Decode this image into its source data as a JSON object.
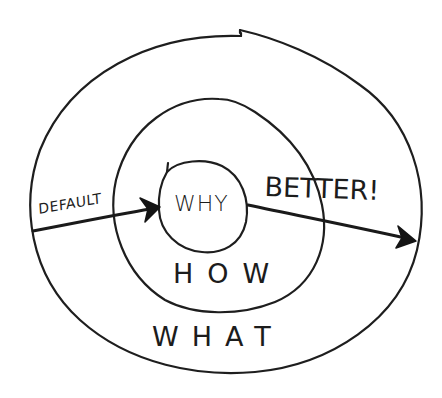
{
  "diagram": {
    "type": "concentric-circles-sketch",
    "style": "hand-drawn ink sketch",
    "colors": {
      "background": "#ffffff",
      "ink": "#1e1e1e"
    },
    "rings": [
      {
        "id": "inner",
        "label": "WHY"
      },
      {
        "id": "middle",
        "label": "HOW"
      },
      {
        "id": "outer",
        "label": "WHAT"
      }
    ],
    "arrows": [
      {
        "id": "default",
        "label": "DEFAULT",
        "from": "outside-left",
        "to": "inner"
      },
      {
        "id": "better",
        "label": "BETTER!",
        "from": "inner",
        "to": "outside-right"
      }
    ]
  },
  "labels": {
    "why": "WHY",
    "how": "HOW",
    "what": "WHAT",
    "default": "DEFAULT",
    "better": "BETTER!"
  }
}
